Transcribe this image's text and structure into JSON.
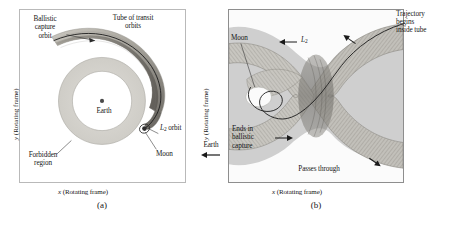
{
  "figure": {
    "type": "scientific-diagram"
  },
  "panel_a": {
    "caption": "(a)",
    "x_axis_label": "x (Rotating frame)",
    "y_axis_label": "y (Rotating frame)",
    "labels": {
      "ballistic_capture": "Ballistic\ncapture\norbit",
      "tube": "Tube of transit\norbits",
      "earth": "Earth",
      "moon": "Moon",
      "l2_orbit": "L2 orbit",
      "l2_orbit_base": "L",
      "l2_orbit_sub": "2",
      "l2_orbit_rest": " orbit",
      "forbidden": "Forbidden\nregion"
    },
    "colors": {
      "background": "#ffffff",
      "border": "#b9b9b9",
      "forbidden_region": "#d7d5d0",
      "forbidden_region_edge": "#a6a49f",
      "tube_fill": "#b0aca4",
      "tube_dark": "#6d6a64",
      "trajectory": "#1a1a1a",
      "earth_dot": "#4a4a4a",
      "moon_dot": "#2e2e2e"
    }
  },
  "panel_b": {
    "caption": "(b)",
    "x_axis_label": "x (Rotating frame)",
    "y_axis_label": "y (Rotating frame)",
    "labels": {
      "trajectory_begins": "Trajectory\nbegins\ninside tube",
      "moon": "Moon",
      "l2": "L2",
      "l2_base": "L",
      "l2_sub": "2",
      "ends_in_capture": "Ends in\nballistic\ncapture",
      "passes_through_line1": "Passes through",
      "passes_through_line2_base": "L",
      "passes_through_line2_sub": "2",
      "passes_through_line2_rest": " equilibrium region"
    },
    "colors": {
      "background": "#cfcfcf",
      "border": "#8e8e8e",
      "tube_mesh": "#8a8882",
      "tube_light": "#e3e1dc",
      "tube_shadow": "#6a6862",
      "trajectory": "#111111",
      "white_region": "#fdfdfd"
    }
  },
  "between_panels": {
    "y_axis_label": "y (Rotating frame)",
    "earth_label": "Earth",
    "earth_direction_icon": "left-arrow"
  }
}
